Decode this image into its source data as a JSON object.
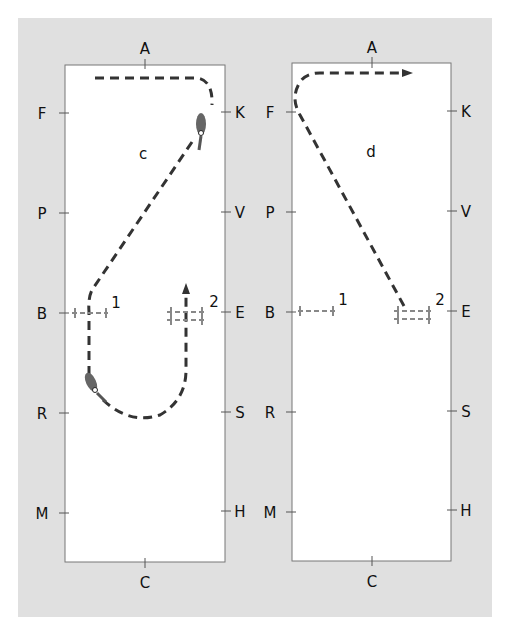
{
  "diagrams": [
    {
      "id": "c",
      "label": "c",
      "markers": {
        "top": "A",
        "bottom": "C",
        "left": [
          "F",
          "P",
          "B",
          "R",
          "M"
        ],
        "right": [
          "K",
          "V",
          "E",
          "S",
          "H"
        ]
      },
      "pole_labels": [
        "1",
        "2"
      ]
    },
    {
      "id": "d",
      "label": "d",
      "markers": {
        "top": "A",
        "bottom": "C",
        "left": [
          "F",
          "P",
          "B",
          "R",
          "M"
        ],
        "right": [
          "K",
          "V",
          "E",
          "S",
          "H"
        ]
      },
      "pole_labels": [
        "1",
        "2"
      ]
    }
  ],
  "colors": {
    "background": "#e0e0e0",
    "arena": "#ffffff",
    "path": "#333333",
    "pole": "#888888",
    "horse": "#555555"
  }
}
